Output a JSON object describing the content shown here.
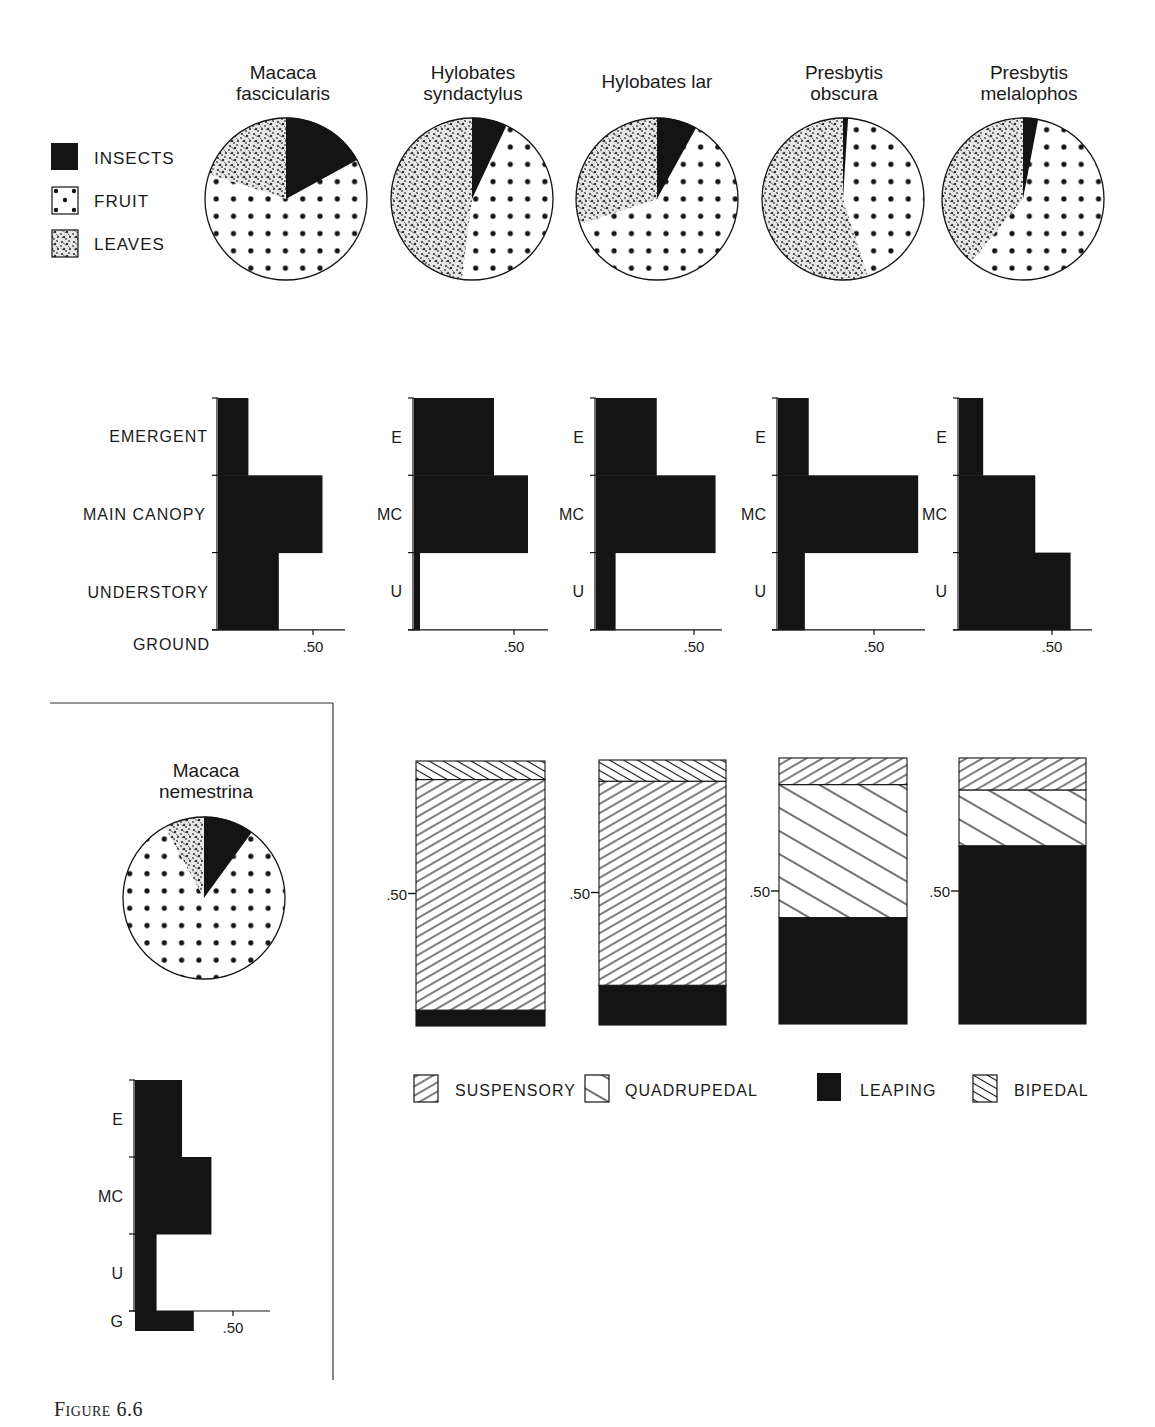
{
  "figure_label": "Figure 6.6",
  "colors": {
    "ink": "#141414",
    "paper": "#ffffff",
    "leaves_bg": "#d9d9d9"
  },
  "chart_data": [
    {
      "type": "pie",
      "title": "Diet composition",
      "legend": [
        {
          "key": "insects",
          "label": "INSECTS",
          "pattern": "solid-black"
        },
        {
          "key": "fruit",
          "label": "FRUIT",
          "pattern": "dots"
        },
        {
          "key": "leaves",
          "label": "LEAVES",
          "pattern": "stipple"
        }
      ],
      "legend_position": "left",
      "pies": [
        {
          "species": "Macaca fascicularis",
          "title_lines": [
            "Macaca",
            "fascicularis"
          ],
          "insects": 0.17,
          "fruit": 0.63,
          "leaves": 0.2
        },
        {
          "species": "Hylobates syndactylus",
          "title_lines": [
            "Hylobates",
            "syndactylus"
          ],
          "insects": 0.07,
          "fruit": 0.45,
          "leaves": 0.48
        },
        {
          "species": "Hylobates lar",
          "title_lines": [
            "Hylobates lar"
          ],
          "insects": 0.08,
          "fruit": 0.62,
          "leaves": 0.3
        },
        {
          "species": "Presbytis obscura",
          "title_lines": [
            "Presbytis",
            "obscura"
          ],
          "insects": 0.01,
          "fruit": 0.44,
          "leaves": 0.55
        },
        {
          "species": "Presbytis melalophos",
          "title_lines": [
            "Presbytis",
            "melalophos"
          ],
          "insects": 0.03,
          "fruit": 0.58,
          "leaves": 0.39
        },
        {
          "species": "Macaca nemestrina",
          "title_lines": [
            "Macaca",
            "nemestrina"
          ],
          "insects": 0.1,
          "fruit": 0.82,
          "leaves": 0.08
        }
      ]
    },
    {
      "type": "bar",
      "orientation": "horizontal",
      "title": "Forest strata use",
      "ylabel_full": [
        "EMERGENT",
        "MAIN CANOPY",
        "UNDERSTORY",
        "GROUND"
      ],
      "ylabel_abbrev": [
        "E",
        "MC",
        "U",
        "G"
      ],
      "xtick_label": ".50",
      "xlim": [
        0,
        0.75
      ],
      "series": [
        {
          "species": "Macaca fascicularis",
          "emergent": 0.16,
          "main_canopy": 0.55,
          "understory": 0.32
        },
        {
          "species": "Hylobates syndactylus",
          "emergent": 0.4,
          "main_canopy": 0.57,
          "understory": 0.03
        },
        {
          "species": "Hylobates lar",
          "emergent": 0.31,
          "main_canopy": 0.61,
          "understory": 0.1
        },
        {
          "species": "Presbytis obscura",
          "emergent": 0.16,
          "main_canopy": 0.73,
          "understory": 0.14
        },
        {
          "species": "Presbytis melalophos",
          "emergent": 0.13,
          "main_canopy": 0.41,
          "understory": 0.6
        },
        {
          "species": "Macaca nemestrina",
          "emergent": 0.24,
          "main_canopy": 0.39,
          "understory": 0.11,
          "ground": 0.3
        }
      ]
    },
    {
      "type": "bar",
      "stacked": true,
      "title": "Locomotion",
      "ytick_label": ".50",
      "ylim": [
        0,
        1.0
      ],
      "categories": [
        "Hylobates syndactylus",
        "Hylobates lar",
        "Presbytis obscura",
        "Presbytis melalophos"
      ],
      "legend": [
        {
          "key": "suspensory",
          "label": "SUSPENSORY",
          "pattern": "hatch-forward"
        },
        {
          "key": "quadrupedal",
          "label": "QUADRUPEDAL",
          "pattern": "hatch-back-wide"
        },
        {
          "key": "leaping",
          "label": "LEAPING",
          "pattern": "solid-black"
        },
        {
          "key": "bipedal",
          "label": "BIPEDAL",
          "pattern": "hatch-back-dense"
        }
      ],
      "legend_position": "bottom",
      "bars": [
        {
          "stack": [
            {
              "key": "leaping",
              "value": 0.06
            },
            {
              "key": "suspensory",
              "value": 0.87
            },
            {
              "key": "bipedal",
              "value": 0.07
            }
          ]
        },
        {
          "stack": [
            {
              "key": "leaping",
              "value": 0.15
            },
            {
              "key": "suspensory",
              "value": 0.77
            },
            {
              "key": "bipedal",
              "value": 0.08
            }
          ]
        },
        {
          "stack": [
            {
              "key": "leaping",
              "value": 0.4
            },
            {
              "key": "quadrupedal",
              "value": 0.5
            },
            {
              "key": "suspensory",
              "value": 0.1
            }
          ]
        },
        {
          "stack": [
            {
              "key": "leaping",
              "value": 0.67
            },
            {
              "key": "quadrupedal",
              "value": 0.21
            },
            {
              "key": "suspensory",
              "value": 0.12
            }
          ]
        }
      ]
    }
  ]
}
